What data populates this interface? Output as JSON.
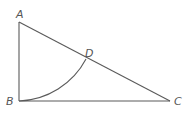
{
  "diagram": {
    "type": "geometry",
    "points": {
      "A": {
        "label": "A",
        "x": 19,
        "y": 22
      },
      "B": {
        "label": "B",
        "x": 19,
        "y": 101
      },
      "C": {
        "label": "C",
        "x": 170,
        "y": 101
      },
      "D": {
        "label": "D",
        "x": 86,
        "y": 59
      }
    },
    "segments": [
      "AB",
      "BC",
      "AC"
    ],
    "arcs": [
      {
        "center": "A",
        "from": "B",
        "to": "D"
      }
    ],
    "colors": {
      "stroke": "#5a5a5a",
      "label": "#555555"
    }
  }
}
